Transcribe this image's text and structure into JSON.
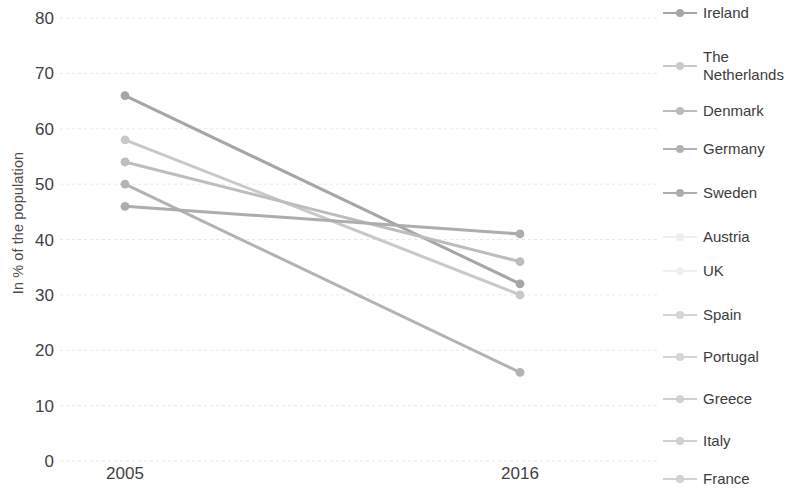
{
  "chart_data": {
    "type": "line",
    "title": "",
    "subtitle": "",
    "xlabel": "",
    "ylabel": "In % of the population",
    "x": [
      "2005",
      "2016"
    ],
    "categories": [
      "2005",
      "2016"
    ],
    "xlim": [
      0,
      1
    ],
    "ylim": [
      0,
      80
    ],
    "yticks": [
      0,
      10,
      20,
      30,
      40,
      50,
      60,
      70,
      80
    ],
    "ytick_labels": [
      "0",
      "10",
      "20",
      "30",
      "40",
      "50",
      "60",
      "70",
      "80"
    ],
    "xtick_labels": [
      "2005",
      "2016"
    ],
    "grid": "horizontal-dotted-light",
    "legend_position": "right",
    "marker": "circle",
    "series": [
      {
        "name": "Ireland",
        "values": [
          66,
          32
        ],
        "color": "#a6a6a6",
        "visible": true
      },
      {
        "name": "The Netherlands",
        "values": [
          58,
          30
        ],
        "color": "#c9c9c9",
        "visible": true
      },
      {
        "name": "Denmark",
        "values": [
          54,
          36
        ],
        "color": "#bdbdbd",
        "visible": true
      },
      {
        "name": "Germany",
        "values": [
          50,
          16
        ],
        "color": "#b3b3b3",
        "visible": true
      },
      {
        "name": "Sweden",
        "values": [
          46,
          41
        ],
        "color": "#adadad",
        "visible": true
      },
      {
        "name": "Austria",
        "values": [
          null,
          null
        ],
        "color": "#ededed",
        "visible": false
      },
      {
        "name": "UK",
        "values": [
          null,
          null
        ],
        "color": "#efefef",
        "visible": false
      },
      {
        "name": "Spain",
        "values": [
          null,
          null
        ],
        "color": "#d4d4d4",
        "visible": false
      },
      {
        "name": "Portugal",
        "values": [
          null,
          null
        ],
        "color": "#d4d4d4",
        "visible": false
      },
      {
        "name": "Greece",
        "values": [
          null,
          null
        ],
        "color": "#cfcfcf",
        "visible": false
      },
      {
        "name": "Italy",
        "values": [
          null,
          null
        ],
        "color": "#d0d0d0",
        "visible": false
      },
      {
        "name": "France",
        "values": [
          null,
          null
        ],
        "color": "#d2d2d2",
        "visible": false
      }
    ]
  },
  "axes": {
    "y_title": "In % of the population",
    "y_ticks": [
      "80",
      "70",
      "60",
      "50",
      "40",
      "30",
      "20",
      "10",
      "0"
    ],
    "x_ticks": [
      "2005",
      "2016"
    ]
  },
  "legend": {
    "items": [
      {
        "label": "Ireland"
      },
      {
        "label": "The Netherlands"
      },
      {
        "label": "Denmark"
      },
      {
        "label": "Germany"
      },
      {
        "label": "Sweden"
      },
      {
        "label": "Austria"
      },
      {
        "label": "UK"
      },
      {
        "label": "Spain"
      },
      {
        "label": "Portugal"
      },
      {
        "label": "Greece"
      },
      {
        "label": "Italy"
      },
      {
        "label": "France"
      }
    ]
  },
  "colors": {
    "background": "#ffffff",
    "gridline": "#e8e8e8",
    "tick_text": "#3f3f3f",
    "axis_title": "#4b4b4b",
    "legend_text": "#3c3c3c",
    "series_gray": "#b0b0b0",
    "series_faint": "#e4e4e4"
  }
}
